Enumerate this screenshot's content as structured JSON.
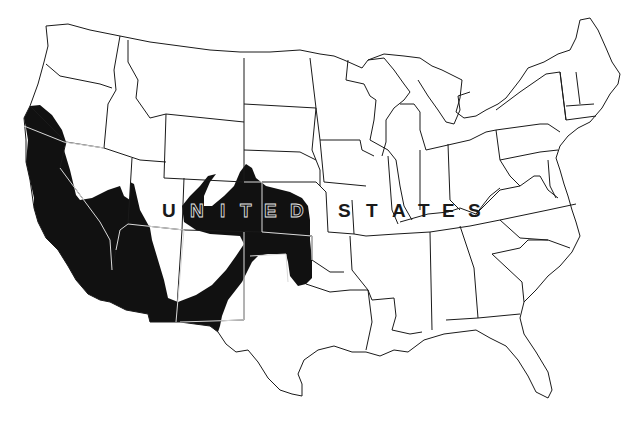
{
  "map": {
    "title": "UNITED STATES",
    "label_words": [
      "UNITED",
      "STATES"
    ],
    "letters": {
      "united": [
        "U",
        "N",
        "I",
        "T",
        "E",
        "D"
      ],
      "states": [
        "S",
        "T",
        "A",
        "T",
        "E",
        "S"
      ]
    },
    "type": "choropleth / range map",
    "shaded_color": "#111111",
    "background_color": "#ffffff",
    "border_color": "#1a1a1a",
    "shaded_region": "Southwestern United States: California, western Oregon (south), southern Nevada, Arizona, southern Utah, western/southern New Mexico, Colorado, western Kansas, Oklahoma panhandle, southwestern Nebraska, far west Texas tip"
  }
}
